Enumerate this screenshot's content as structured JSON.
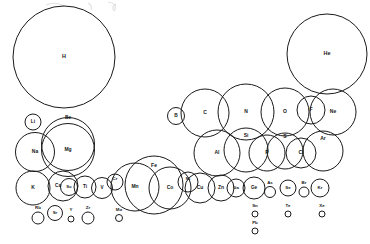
{
  "figure": {
    "background_color": "#ffffff",
    "stroke_color": "#1a1a1a",
    "label_color": "#161616",
    "width": 370,
    "height": 244
  },
  "chart_data": {
    "type": "scatter",
    "xlabel": "",
    "ylabel": "",
    "note": "Each element is drawn as a circle whose radius is proportional to its atomic radius; circle centers follow the periodic table layout.",
    "elements": [
      {
        "symbol": "H",
        "cx": 64,
        "cy": 57,
        "r": 51,
        "label_dx": 0,
        "label_dy": 0,
        "font": 5.4,
        "label_inside": true
      },
      {
        "symbol": "He",
        "cx": 327,
        "cy": 54,
        "r": 40,
        "label_dx": 0,
        "label_dy": 0,
        "font": 5.4,
        "label_inside": true
      },
      {
        "symbol": "Li",
        "cx": 33,
        "cy": 122,
        "r": 8,
        "label_dx": 0,
        "label_dy": 0,
        "font": 4.8,
        "label_inside": true
      },
      {
        "symbol": "Be",
        "cx": 68,
        "cy": 144,
        "r": 26.5,
        "label_dx": 0,
        "label_dy": -26,
        "font": 4.8,
        "label_inside": false
      },
      {
        "symbol": "B",
        "cx": 176,
        "cy": 116,
        "r": 8.5,
        "label_dx": 0,
        "label_dy": 0,
        "font": 4.8,
        "label_inside": true
      },
      {
        "symbol": "C",
        "cx": 205,
        "cy": 113,
        "r": 24,
        "label_dx": 0,
        "label_dy": 0,
        "font": 5.0,
        "label_inside": true
      },
      {
        "symbol": "N",
        "cx": 246,
        "cy": 112,
        "r": 28,
        "label_dx": 0,
        "label_dy": 0,
        "font": 5.0,
        "label_inside": true
      },
      {
        "symbol": "O",
        "cx": 285,
        "cy": 112,
        "r": 24,
        "label_dx": 0,
        "label_dy": 0,
        "font": 5.0,
        "label_inside": true
      },
      {
        "symbol": "F",
        "cx": 311,
        "cy": 110,
        "r": 14,
        "label_dx": 0,
        "label_dy": 0,
        "font": 5.0,
        "label_inside": true
      },
      {
        "symbol": "Ne",
        "cx": 333,
        "cy": 112,
        "r": 23,
        "label_dx": 0,
        "label_dy": 0,
        "font": 5.0,
        "label_inside": true
      },
      {
        "symbol": "Na",
        "cx": 35,
        "cy": 152,
        "r": 19.5,
        "label_dx": 0,
        "label_dy": 0,
        "font": 5.0,
        "label_inside": true
      },
      {
        "symbol": "Mg",
        "cx": 68,
        "cy": 150,
        "r": 26.5,
        "label_dx": 0,
        "label_dy": 0,
        "font": 5.0,
        "label_inside": true
      },
      {
        "symbol": "Al",
        "cx": 217,
        "cy": 153,
        "r": 23,
        "label_dx": 0,
        "label_dy": 0,
        "font": 5.0,
        "label_inside": true
      },
      {
        "symbol": "Si",
        "cx": 246,
        "cy": 150,
        "r": 22,
        "label_dx": 0,
        "label_dy": -14,
        "font": 5.0,
        "label_inside": false
      },
      {
        "symbol": "P",
        "cx": 267,
        "cy": 153,
        "r": 18,
        "label_dx": 0,
        "label_dy": 0,
        "font": 5.0,
        "label_inside": true
      },
      {
        "symbol": "S",
        "cx": 285,
        "cy": 151,
        "r": 18,
        "label_dx": 0,
        "label_dy": -14,
        "font": 5.0,
        "label_inside": false
      },
      {
        "symbol": "Cl",
        "cx": 301,
        "cy": 153,
        "r": 15,
        "label_dx": 0,
        "label_dy": 0,
        "font": 5.0,
        "label_inside": true
      },
      {
        "symbol": "Ar",
        "cx": 323,
        "cy": 151,
        "r": 20,
        "label_dx": 0,
        "label_dy": -12,
        "font": 5.0,
        "label_inside": false
      },
      {
        "symbol": "K",
        "cx": 33,
        "cy": 188,
        "r": 17,
        "label_dx": 0,
        "label_dy": 0,
        "font": 5.0,
        "label_inside": true
      },
      {
        "symbol": "Ca",
        "cx": 63,
        "cy": 186,
        "r": 15,
        "label_dx": -5,
        "label_dy": 0,
        "font": 4.6,
        "label_inside": true
      },
      {
        "symbol": "Sc",
        "cx": 69,
        "cy": 187,
        "r": 8.5,
        "label_dx": 0,
        "label_dy": 0,
        "font": 4.4,
        "label_inside": true
      },
      {
        "symbol": "Ti",
        "cx": 85,
        "cy": 187,
        "r": 11,
        "label_dx": 0,
        "label_dy": 0,
        "font": 4.6,
        "label_inside": true
      },
      {
        "symbol": "V",
        "cx": 102,
        "cy": 188,
        "r": 10.5,
        "label_dx": 0,
        "label_dy": 0,
        "font": 4.6,
        "label_inside": true
      },
      {
        "symbol": "Cr",
        "cx": 115,
        "cy": 182,
        "r": 8,
        "label_dx": 0,
        "label_dy": -3,
        "font": 4.4,
        "label_inside": true
      },
      {
        "symbol": "Mn",
        "cx": 135,
        "cy": 187,
        "r": 24,
        "label_dx": 0,
        "label_dy": 0,
        "font": 5.0,
        "label_inside": true
      },
      {
        "symbol": "Fe",
        "cx": 154,
        "cy": 185,
        "r": 29,
        "label_dx": 0,
        "label_dy": -19,
        "font": 5.0,
        "label_inside": false
      },
      {
        "symbol": "Co",
        "cx": 170,
        "cy": 188,
        "r": 21,
        "label_dx": 0,
        "label_dy": 0,
        "font": 5.0,
        "label_inside": true
      },
      {
        "symbol": "Ni",
        "cx": 188,
        "cy": 182,
        "r": 10,
        "label_dx": 0,
        "label_dy": -3,
        "font": 4.4,
        "label_inside": true
      },
      {
        "symbol": "Cu",
        "cx": 200,
        "cy": 188,
        "r": 15,
        "label_dx": 0,
        "label_dy": 0,
        "font": 5.0,
        "label_inside": true
      },
      {
        "symbol": "Zn",
        "cx": 221,
        "cy": 188,
        "r": 13,
        "label_dx": 0,
        "label_dy": 0,
        "font": 5.0,
        "label_inside": true
      },
      {
        "symbol": "Ga",
        "cx": 236,
        "cy": 188,
        "r": 9,
        "label_dx": 0,
        "label_dy": 0,
        "font": 4.4,
        "label_inside": true
      },
      {
        "symbol": "Ge",
        "cx": 254,
        "cy": 188,
        "r": 11,
        "label_dx": 0,
        "label_dy": 0,
        "font": 4.6,
        "label_inside": true
      },
      {
        "symbol": "As",
        "cx": 270,
        "cy": 192,
        "r": 5.5,
        "label_dx": 0,
        "label_dy": -9,
        "font": 4.4,
        "label_inside": false
      },
      {
        "symbol": "Se",
        "cx": 288,
        "cy": 188,
        "r": 8,
        "label_dx": 0,
        "label_dy": 0,
        "font": 4.4,
        "label_inside": true
      },
      {
        "symbol": "Br",
        "cx": 304,
        "cy": 192,
        "r": 5,
        "label_dx": 0,
        "label_dy": -9,
        "font": 4.4,
        "label_inside": false
      },
      {
        "symbol": "Kr",
        "cx": 320,
        "cy": 188,
        "r": 9,
        "label_dx": 0,
        "label_dy": 0,
        "font": 4.4,
        "label_inside": true
      },
      {
        "symbol": "Rb",
        "cx": 38,
        "cy": 218,
        "r": 6,
        "label_dx": 0,
        "label_dy": -10,
        "font": 4.4,
        "label_inside": false
      },
      {
        "symbol": "Sr",
        "cx": 55,
        "cy": 213,
        "r": 7.5,
        "label_dx": 0,
        "label_dy": 0,
        "font": 4.4,
        "label_inside": true
      },
      {
        "symbol": "Y",
        "cx": 71,
        "cy": 219,
        "r": 3,
        "label_dx": 0,
        "label_dy": -9,
        "font": 4.4,
        "label_inside": false
      },
      {
        "symbol": "Zr",
        "cx": 88,
        "cy": 218,
        "r": 6,
        "label_dx": 0,
        "label_dy": -10,
        "font": 4.4,
        "label_inside": false
      },
      {
        "symbol": "Mo",
        "cx": 119,
        "cy": 218,
        "r": 3.5,
        "label_dx": 0,
        "label_dy": -8,
        "font": 4.4,
        "label_inside": false
      },
      {
        "symbol": "Sn",
        "cx": 255,
        "cy": 214,
        "r": 3,
        "label_dx": 0,
        "label_dy": -8,
        "font": 4.4,
        "label_inside": false
      },
      {
        "symbol": "Te",
        "cx": 288,
        "cy": 214,
        "r": 3,
        "label_dx": 0,
        "label_dy": -8,
        "font": 4.4,
        "label_inside": false
      },
      {
        "symbol": "Xe",
        "cx": 322,
        "cy": 214,
        "r": 3,
        "label_dx": 0,
        "label_dy": -8,
        "font": 4.4,
        "label_inside": false
      },
      {
        "symbol": "Pb",
        "cx": 255,
        "cy": 231,
        "r": 3,
        "label_dx": 0,
        "label_dy": -8,
        "font": 4.4,
        "label_inside": false
      }
    ]
  }
}
